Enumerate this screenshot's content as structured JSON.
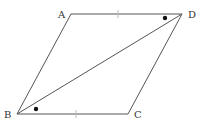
{
  "diagram": {
    "type": "parallelogram",
    "vertices": {
      "A": {
        "label": "A",
        "x": 71,
        "y": 14
      },
      "B": {
        "label": "B",
        "x": 17,
        "y": 114
      },
      "C": {
        "label": "C",
        "x": 128,
        "y": 114
      },
      "D": {
        "label": "D",
        "x": 182,
        "y": 14
      }
    },
    "segments": [
      "AB",
      "BC",
      "CD",
      "DA",
      "BD"
    ],
    "equal_length_marks": [
      "AD",
      "BC"
    ],
    "equal_angle_marks": [
      "angle ADB",
      "angle CBD"
    ],
    "colors": {
      "line": "#555555",
      "mark": "#111111",
      "tick": "#bbbbbb"
    }
  }
}
